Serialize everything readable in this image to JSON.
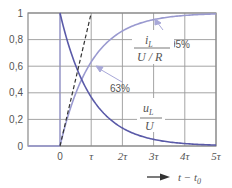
{
  "chart_data": {
    "type": "line",
    "title": "",
    "xlabel": "t − t0",
    "ylabel": "",
    "xlim": [
      -1,
      5
    ],
    "ylim": [
      0,
      1
    ],
    "grid": true,
    "x_tick_labels": [
      "0",
      "τ",
      "2τ",
      "3τ",
      "4τ",
      "5τ"
    ],
    "x_tick_values": [
      0,
      1,
      2,
      3,
      4,
      5
    ],
    "y_tick_labels": [
      "0",
      "0,2",
      "0,4",
      "0,6",
      "0,8",
      "1"
    ],
    "y_tick_values": [
      0,
      0.2,
      0.4,
      0.6,
      0.8,
      1.0
    ],
    "series": [
      {
        "name": "i_L / (U/R)",
        "label_num": "i",
        "label_num_sub": "L",
        "label_den": "U / R",
        "formula": "1 - exp(-t/τ)",
        "color": "#9a9ad0",
        "x": [
          0,
          0.5,
          1,
          1.5,
          2,
          2.5,
          3,
          3.5,
          4,
          4.5,
          5
        ],
        "values": [
          0,
          0.39,
          0.63,
          0.78,
          0.86,
          0.92,
          0.95,
          0.97,
          0.98,
          0.99,
          0.99
        ]
      },
      {
        "name": "u_L / U",
        "label_num": "u",
        "label_num_sub": "L",
        "label_den": "U",
        "formula": "exp(-t/τ)",
        "color": "#5a5aa8",
        "x": [
          0,
          0.5,
          1,
          1.5,
          2,
          2.5,
          3,
          3.5,
          4,
          4.5,
          5
        ],
        "values": [
          1,
          0.61,
          0.37,
          0.22,
          0.14,
          0.08,
          0.05,
          0.03,
          0.02,
          0.01,
          0.01
        ]
      },
      {
        "name": "tangent at t0",
        "style": "dashed",
        "color": "#333333",
        "x": [
          0,
          1
        ],
        "values": [
          0,
          1
        ]
      }
    ],
    "annotations": [
      {
        "text": "63%",
        "x": 1,
        "y": 0.63
      },
      {
        "text": "95%",
        "x": 3,
        "y": 0.95
      }
    ],
    "axis_arrow_label": "t − t",
    "axis_arrow_label_sub": "0"
  }
}
